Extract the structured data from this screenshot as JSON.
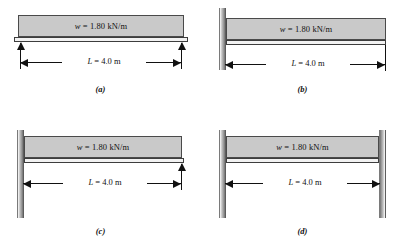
{
  "figure": {
    "panels": [
      {
        "id": "a",
        "caption": "(a)",
        "load_label": "w = 1.80 kN/m",
        "load_symbol": "w",
        "load_value": "1.80 kN/m",
        "dimension_label": "L = 4.0 m",
        "dimension_symbol": "L",
        "dimension_value": "4.0 m",
        "support_type": "simply-supported",
        "left_support": "reaction-arrow",
        "right_support": "reaction-arrow"
      },
      {
        "id": "b",
        "caption": "(b)",
        "load_label": "w = 1.80 kN/m",
        "load_symbol": "w",
        "load_value": "1.80 kN/m",
        "dimension_label": "L = 4.0 m",
        "dimension_symbol": "L",
        "dimension_value": "4.0 m",
        "support_type": "cantilever",
        "left_support": "fixed-wall",
        "right_support": "free-end"
      },
      {
        "id": "c",
        "caption": "(c)",
        "load_label": "w = 1.80 kN/m",
        "load_symbol": "w",
        "load_value": "1.80 kN/m",
        "dimension_label": "L = 4.0 m",
        "dimension_symbol": "L",
        "dimension_value": "4.0 m",
        "support_type": "propped-cantilever",
        "left_support": "fixed-wall",
        "right_support": "reaction-arrow"
      },
      {
        "id": "d",
        "caption": "(d)",
        "load_label": "w = 1.80 kN/m",
        "load_symbol": "w",
        "load_value": "1.80 kN/m",
        "dimension_label": "L = 4.0 m",
        "dimension_symbol": "L",
        "dimension_value": "4.0 m",
        "support_type": "fixed-fixed",
        "left_support": "fixed-wall",
        "right_support": "fixed-wall"
      }
    ],
    "colors": {
      "load_fill": "#c9c9c9",
      "load_stroke": "#4a4a4a",
      "beam_fill": "#f2f2f2",
      "beam_stroke": "#3d3d3d",
      "wall_fill": "#a8a8a8",
      "line": "#111111",
      "background": "#ffffff"
    }
  }
}
